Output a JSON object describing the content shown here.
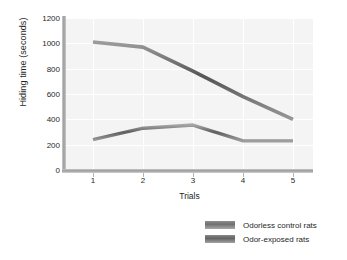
{
  "chart_data": {
    "type": "line",
    "title": "",
    "xlabel": "Trials",
    "ylabel": "Hiding time (seconds)",
    "categories": [
      "1",
      "2",
      "3",
      "4",
      "5"
    ],
    "x": [
      1,
      2,
      3,
      4,
      5
    ],
    "xlim": [
      0.6,
      5.4
    ],
    "ylim": [
      0,
      1200
    ],
    "yticks": [
      0,
      200,
      400,
      600,
      800,
      1000,
      1200
    ],
    "xticks": [
      "1",
      "2",
      "3",
      "4",
      "5"
    ],
    "grid": true,
    "legend_position": "bottom-right",
    "series": [
      {
        "name": "Odorless control rats",
        "color": "#6f6f6f",
        "values": [
          240,
          330,
          355,
          230,
          230
        ]
      },
      {
        "name": "Odor-exposed rats",
        "color": "#636363",
        "values": [
          1010,
          970,
          780,
          580,
          400
        ]
      }
    ]
  },
  "axes": {
    "ylabel": "Hiding time (seconds)",
    "xlabel": "Trials",
    "ytick_labels": [
      "1200",
      "1000",
      "800",
      "600",
      "400",
      "200",
      "0"
    ],
    "xtick_labels": [
      "1",
      "2",
      "3",
      "4",
      "5"
    ]
  },
  "legend": {
    "items": [
      {
        "label": "Odorless control rats",
        "swatch": "odorless-swatch"
      },
      {
        "label": "Odor-exposed rats",
        "swatch": "odor-exposed-swatch"
      }
    ]
  }
}
